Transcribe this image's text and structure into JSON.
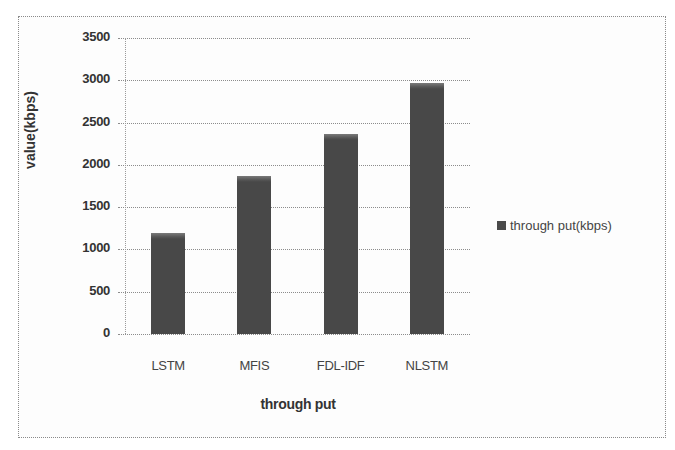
{
  "chart_data": {
    "type": "bar",
    "title": "",
    "xlabel": "through put",
    "ylabel": "value(kbps)",
    "categories": [
      "LSTM",
      "MFIS",
      "FDL-IDF",
      "NLSTM"
    ],
    "series": [
      {
        "name": "through put(kbps)",
        "values": [
          1200,
          1870,
          2370,
          2970
        ],
        "color": "#4a4a4a"
      }
    ],
    "values": [
      1200,
      1870,
      2370,
      2970
    ],
    "ylim": [
      0,
      3500
    ],
    "yticks": [
      0,
      500,
      1000,
      1500,
      2000,
      2500,
      3000,
      3500
    ],
    "grid": true,
    "legend_position": "right"
  },
  "axis": {
    "yticks": [
      "0",
      "500",
      "1000",
      "1500",
      "2000",
      "2500",
      "3000",
      "3500"
    ]
  },
  "legend": {
    "label": "through put(kbps)"
  }
}
